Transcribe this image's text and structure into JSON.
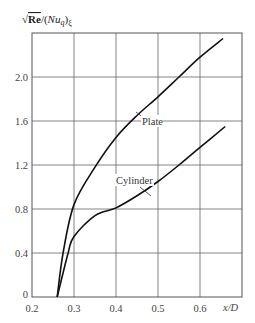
{
  "chart_data": {
    "type": "line",
    "title": "",
    "xlabel": "x/D",
    "ylabel": "√Re/(Nu_q)_ξ",
    "xlim": [
      0.2,
      0.7
    ],
    "ylim": [
      0,
      2.4
    ],
    "grid": true,
    "legend": "none (inline labels)",
    "x_ticks": [
      "0.2",
      "0.3",
      "0.4",
      "0.5",
      "0.6"
    ],
    "y_ticks": [
      "0",
      "0.4",
      "0.8",
      "1.2",
      "1.6",
      "2.0"
    ],
    "series": [
      {
        "name": "Plate",
        "x": [
          0.26,
          0.274,
          0.3,
          0.35,
          0.4,
          0.45,
          0.5,
          0.55,
          0.6,
          0.655
        ],
        "y": [
          0.0,
          0.4,
          0.84,
          1.18,
          1.45,
          1.65,
          1.82,
          2.0,
          2.18,
          2.35
        ]
      },
      {
        "name": "Cylinder",
        "x": [
          0.26,
          0.286,
          0.3,
          0.35,
          0.4,
          0.45,
          0.5,
          0.55,
          0.6,
          0.66
        ],
        "y": [
          0.0,
          0.4,
          0.55,
          0.74,
          0.81,
          0.92,
          1.05,
          1.2,
          1.36,
          1.55
        ]
      }
    ],
    "annotations": [
      {
        "text": "Plate",
        "x": 0.465,
        "y": 1.6
      },
      {
        "text": "Cylinder",
        "x": 0.415,
        "y": 1.05
      }
    ]
  },
  "labels": {
    "ylabel_sqrt": "√",
    "ylabel_re": "Re",
    "ylabel_rest": "/(",
    "ylabel_nu": "Nu",
    "ylabel_q": "q",
    "ylabel_close": ")",
    "ylabel_xi": "ξ",
    "xlabel": "x/D",
    "plate": "Plate",
    "cylinder": "Cylinder"
  }
}
